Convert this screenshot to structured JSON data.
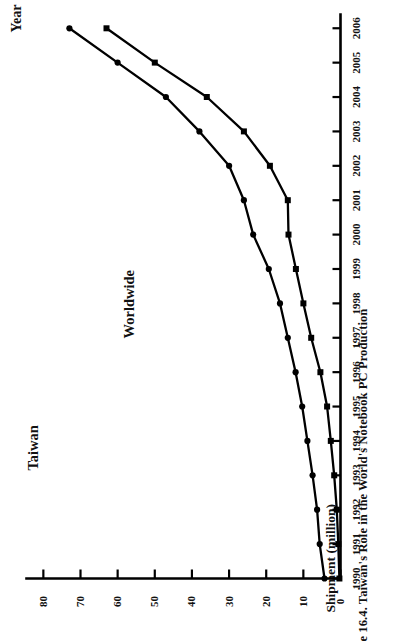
{
  "figure": {
    "caption": "e 16.4. Taiwan's Role in the World's Notebook PC Production",
    "caption_full": "Figure 16.4. Taiwan's Role in the World's Notebook PC Production",
    "orientation": "rotated-90-ccw",
    "ink_color": "#000000",
    "background": "#ffffff"
  },
  "chart_data": {
    "type": "line",
    "title": "e 16.4. Taiwan's Role in the World's Notebook PC Production",
    "xlabel": "Year",
    "ylabel": "Shipment (million)",
    "x": [
      1990,
      1991,
      1992,
      1993,
      1994,
      1995,
      1996,
      1997,
      1998,
      1999,
      2000,
      2001,
      2002,
      2003,
      2004,
      2005,
      2006
    ],
    "xtick_labels": [
      "1990",
      "1991",
      "1992",
      "1993",
      "1994",
      "1995",
      "1996",
      "1997",
      "1998",
      "1999",
      "2000",
      "2001",
      "2002",
      "2003",
      "2004",
      "2005",
      "2006"
    ],
    "ytick_labels": [
      "0",
      "10",
      "20",
      "30",
      "40",
      "50",
      "60",
      "70",
      "80"
    ],
    "ytick_values": [
      0,
      10,
      20,
      30,
      40,
      50,
      60,
      70,
      80
    ],
    "ylim": [
      0,
      84
    ],
    "xlim": [
      1990,
      2006.4
    ],
    "grid": false,
    "legend_position": "inline-annotations",
    "series": [
      {
        "name": "Worldwide",
        "marker": "circle",
        "values": [
          4.3,
          5.6,
          6.3,
          7.5,
          8.9,
          10.3,
          12.1,
          14.2,
          16.3,
          19.3,
          23.5,
          26.0,
          30.0,
          38.0,
          47.0,
          60.0,
          73.0
        ]
      },
      {
        "name": "Taiwan",
        "marker": "square",
        "values": [
          0.3,
          0.6,
          1.0,
          1.7,
          2.6,
          3.6,
          5.4,
          7.9,
          10.0,
          12.0,
          14.0,
          14.2,
          19.0,
          26.0,
          36.0,
          50.0,
          63.0
        ]
      }
    ]
  },
  "annotations": {
    "taiwan_label": "Taiwan",
    "worldwide_label": "Worldwide"
  }
}
